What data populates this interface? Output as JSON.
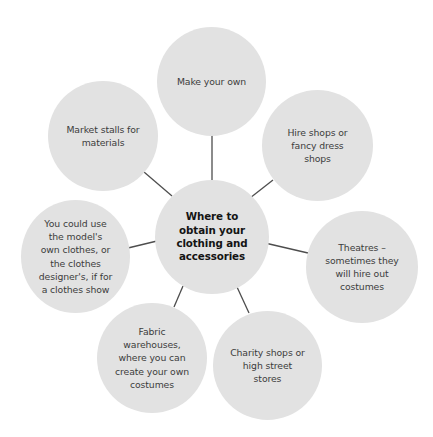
{
  "diagram": {
    "type": "mind-map",
    "line_color": "#4d4d4d",
    "circle_color": "#e2e2e2",
    "center": {
      "label": "Where to\nobtain your\nclothing and\naccessories"
    },
    "nodes": [
      {
        "id": "make-your-own",
        "label": "Make your own"
      },
      {
        "id": "hire-shops",
        "label": "Hire shops or\nfancy dress\nshops"
      },
      {
        "id": "theatres",
        "label": "Theatres –\nsometimes they\nwill hire out\ncostumes"
      },
      {
        "id": "charity-shops",
        "label": "Charity shops or\nhigh street\nstores"
      },
      {
        "id": "fabric-warehouses",
        "label": "Fabric\nwarehouses,\nwhere you can\ncreate your own\ncostumes"
      },
      {
        "id": "models-clothes",
        "label": "You could use\nthe model's\nown clothes, or\nthe clothes\ndesigner's, if for\na clothes show"
      },
      {
        "id": "market-stalls",
        "label": "Market stalls for\nmaterials"
      }
    ]
  }
}
